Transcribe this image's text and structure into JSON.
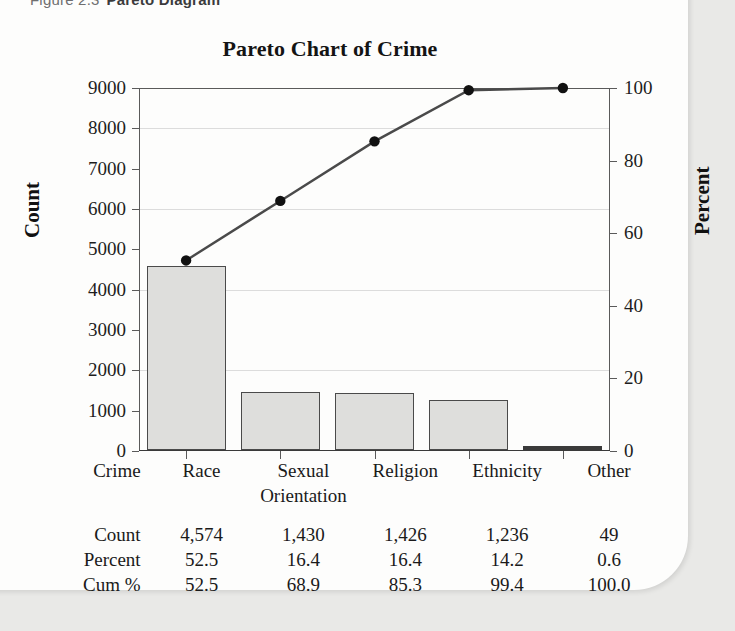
{
  "caption": {
    "figure_number": "Figure 2.3",
    "figure_title": "Pareto Diagram"
  },
  "chart_data": {
    "type": "bar",
    "title": "Pareto Chart of Crime",
    "xlabel": "Crime",
    "ylabel": "Count",
    "y2label": "Percent",
    "categories": [
      "Race",
      "Sexual Orientation",
      "Religion",
      "Ethnicity",
      "Other"
    ],
    "values": [
      4574,
      1430,
      1426,
      1236,
      49
    ],
    "series": [
      {
        "name": "Count",
        "type": "bar",
        "values": [
          4574,
          1430,
          1426,
          1236,
          49
        ]
      },
      {
        "name": "Cum %",
        "type": "line",
        "values": [
          52.5,
          68.9,
          85.3,
          99.4,
          100.0
        ]
      }
    ],
    "ylim": [
      0,
      9000
    ],
    "y2lim": [
      0,
      100
    ],
    "yticks": [
      0,
      1000,
      2000,
      3000,
      4000,
      5000,
      6000,
      7000,
      8000,
      9000
    ],
    "y2ticks": [
      0,
      20,
      40,
      60,
      80,
      100
    ],
    "grid": true,
    "legend": "none",
    "bar_color": "#dededc",
    "bar_border_color": "#4a4a4a",
    "line_color": "#4a4a4a",
    "marker_color": "#111111"
  },
  "axis": {
    "y_left_ticks": [
      "9000",
      "8000",
      "7000",
      "6000",
      "5000",
      "4000",
      "3000",
      "2000",
      "1000",
      "0"
    ],
    "y_right_ticks": [
      "100",
      "80",
      "60",
      "40",
      "20",
      "0"
    ],
    "y_left_title": "Count",
    "y_right_title": "Percent"
  },
  "table": {
    "row_labels": [
      "Crime",
      "Count",
      "Percent",
      "Cum %"
    ],
    "categories": [
      {
        "line1": "Race",
        "line2": ""
      },
      {
        "line1": "Sexual",
        "line2": "Orientation"
      },
      {
        "line1": "Religion",
        "line2": ""
      },
      {
        "line1": "Ethnicity",
        "line2": ""
      },
      {
        "line1": "Other",
        "line2": ""
      }
    ],
    "count": [
      "4,574",
      "1,430",
      "1,426",
      "1,236",
      "49"
    ],
    "percent": [
      "52.5",
      "16.4",
      "16.4",
      "14.2",
      "0.6"
    ],
    "cum_percent": [
      "52.5",
      "68.9",
      "85.3",
      "99.4",
      "100.0"
    ]
  }
}
